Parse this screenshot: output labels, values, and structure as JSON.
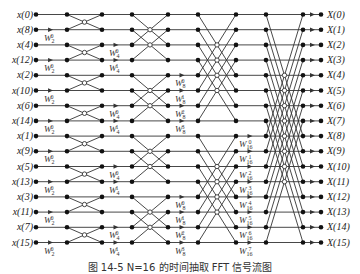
{
  "figure": {
    "caption": "图 14-5  N=16 的时间抽取 FFT 信号流图",
    "inputs": [
      "x(0)",
      "x(8)",
      "x(4)",
      "x(12)",
      "x(2)",
      "x(10)",
      "x(6)",
      "x(14)",
      "x(1)",
      "x(9)",
      "x(5)",
      "x(13)",
      "x(3)",
      "x(11)",
      "x(7)",
      "x(15)"
    ],
    "outputs": [
      "X(0)",
      "X(1)",
      "X(2)",
      "X(3)",
      "X(4)",
      "X(5)",
      "X(6)",
      "X(7)",
      "X(8)",
      "X(9)",
      "X(10)",
      "X(11)",
      "X(12)",
      "X(13)",
      "X(14)",
      "X(15)"
    ],
    "stages": [
      {
        "name": "stage-1",
        "twiddle_base": "2",
        "exponents": [
          0
        ]
      },
      {
        "name": "stage-2",
        "twiddle_base": "4",
        "exponents": [
          0,
          1
        ]
      },
      {
        "name": "stage-3",
        "twiddle_base": "8",
        "exponents": [
          0,
          1,
          2,
          3
        ]
      },
      {
        "name": "stage-4",
        "twiddle_base": "16",
        "exponents": [
          0,
          1,
          2,
          3,
          4,
          5,
          6,
          7
        ]
      }
    ],
    "colors": {
      "line": "#333333",
      "node": "#111111"
    }
  }
}
